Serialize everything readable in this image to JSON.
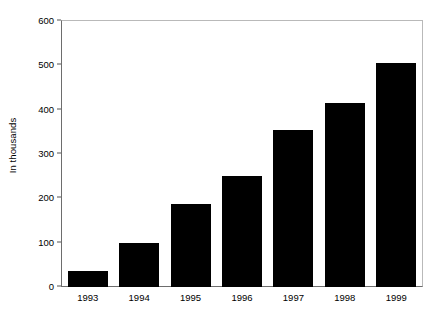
{
  "chart_data": {
    "type": "bar",
    "title": "",
    "subtitle": "",
    "xlabel": "",
    "ylabel": "In thousands",
    "categories": [
      "1993",
      "1994",
      "1995",
      "1996",
      "1997",
      "1998",
      "1999"
    ],
    "values": [
      35,
      100,
      187,
      250,
      355,
      415,
      505
    ],
    "series": [
      {
        "name": "",
        "values": [
          35,
          100,
          187,
          250,
          355,
          415,
          505
        ]
      }
    ],
    "ylim": [
      0,
      600
    ],
    "yticks": [
      0,
      100,
      200,
      300,
      400,
      500,
      600
    ],
    "ytick_labels": [
      "0",
      "100",
      "200",
      "300",
      "400",
      "500",
      "600"
    ],
    "grid": false,
    "legend": false,
    "legend_position": "none",
    "bar_color": "#000000",
    "frame_color": "#6d6d6d",
    "background_color": "#ffffff",
    "annotations": []
  }
}
